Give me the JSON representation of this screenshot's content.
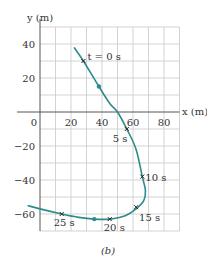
{
  "chart_data": {
    "type": "line",
    "title": "",
    "caption": "(b)",
    "xlabel": "x (m)",
    "ylabel": "y (m)",
    "xlim": [
      -5,
      90
    ],
    "ylim": [
      -70,
      50
    ],
    "grid": true,
    "x_ticks": [
      0,
      20,
      40,
      60,
      80
    ],
    "x_tick_labels": [
      "0",
      "20",
      "40",
      "60",
      "80"
    ],
    "y_ticks": [
      40,
      20,
      -20,
      -40,
      -60
    ],
    "y_tick_labels": [
      "40",
      "20",
      "−20",
      "−40",
      "−60"
    ],
    "series": [
      {
        "name": "particle path",
        "color": "#2e8b8b",
        "x": [
          22,
          28,
          38,
          45,
          50,
          56,
          62,
          66,
          68,
          67,
          62,
          55,
          45,
          35,
          25,
          14,
          0,
          -8
        ],
        "y": [
          38,
          30,
          15,
          5,
          0,
          -10,
          -22,
          -38,
          -46,
          -52,
          -57,
          -61,
          -63,
          -63,
          -62,
          -60,
          -57,
          -55
        ]
      }
    ],
    "time_markers": [
      {
        "label": "t = 0 s",
        "x": 28,
        "y": 30
      },
      {
        "label": "5 s",
        "x": 56,
        "y": -10
      },
      {
        "label": "10 s",
        "x": 66,
        "y": -38
      },
      {
        "label": "15 s",
        "x": 62,
        "y": -56
      },
      {
        "label": "20 s",
        "x": 45,
        "y": -63
      },
      {
        "label": "25 s",
        "x": 14,
        "y": -60
      }
    ],
    "direction_arrows": [
      {
        "x": 38,
        "y": 15
      },
      {
        "x": 35,
        "y": -63
      }
    ]
  }
}
